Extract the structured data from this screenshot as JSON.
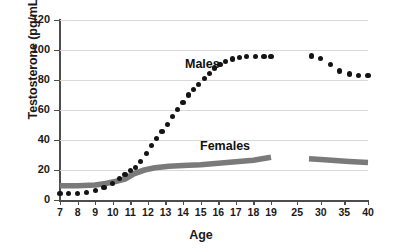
{
  "chart_data": {
    "type": "scatter",
    "title": "",
    "xlabel": "Age",
    "ylabel": "Testosterone (pg/mL)",
    "ylim": [
      0,
      120
    ],
    "ytick_values": [
      0,
      20,
      40,
      60,
      80,
      100,
      120
    ],
    "ytick_labels": [
      "0",
      "20",
      "40",
      "60",
      "80",
      "100",
      "120"
    ],
    "xtick_labels": [
      "7",
      "8",
      "9",
      "10",
      "11",
      "12",
      "13",
      "14",
      "15",
      "16",
      "17",
      "18",
      "19",
      "25",
      "30",
      "35",
      "40"
    ],
    "grid": true,
    "legend_position": "inline-annotations",
    "annotations": [
      {
        "text": "Males",
        "x": 13.2,
        "y": 86
      },
      {
        "text": "Females",
        "x": 14.6,
        "y": 34
      }
    ],
    "series": [
      {
        "name": "Males",
        "marker": "filled-circle",
        "color": "#141414",
        "segments": [
          {
            "x": [
              7.0,
              7.5,
              8.0,
              8.5,
              9.0,
              9.5,
              10.0,
              10.4,
              10.7,
              11.0,
              11.3,
              11.6,
              11.9,
              12.2,
              12.5,
              12.8,
              13.1,
              13.4,
              13.7,
              14.0,
              14.3,
              14.6,
              14.9,
              15.2,
              15.5,
              15.8,
              16.1,
              16.4,
              16.8,
              17.2,
              17.6,
              18.1,
              18.6,
              19.0
            ],
            "y": [
              4.5,
              4.5,
              4.6,
              4.8,
              6.5,
              8.5,
              11.0,
              14.5,
              17.0,
              19.5,
              21.5,
              25.5,
              31.0,
              36.5,
              41.0,
              45.5,
              50.5,
              55.5,
              60.5,
              65.0,
              70.0,
              73.5,
              77.0,
              81.0,
              84.5,
              88.0,
              90.5,
              92.5,
              94.0,
              95.0,
              95.5,
              95.5,
              95.5,
              95.5
            ]
          },
          {
            "x": [
              28.0,
              30.0,
              32.0,
              34.0,
              36.0,
              38.0,
              40.0
            ],
            "y": [
              96.0,
              94.5,
              90.5,
              86.0,
              84.0,
              83.0,
              83.0
            ]
          }
        ]
      },
      {
        "name": "Females",
        "marker": "thick-band",
        "color": "#7a7a7a",
        "segments": [
          {
            "x": [
              7.0,
              8.0,
              9.0,
              9.6,
              10.2,
              10.7,
              11.2,
              11.8,
              12.4,
              13.2,
              14.0,
              15.0,
              16.0,
              17.0,
              18.0,
              19.0
            ],
            "y": [
              9.5,
              9.5,
              10.0,
              11.0,
              12.5,
              14.0,
              17.5,
              20.0,
              21.5,
              22.5,
              23.0,
              23.5,
              24.5,
              25.5,
              26.5,
              28.5
            ]
          },
          {
            "x": [
              27.5,
              30.0,
              33.0,
              36.0,
              38.0,
              40.0
            ],
            "y": [
              27.5,
              27.0,
              26.3,
              25.7,
              25.3,
              25.0
            ]
          }
        ]
      }
    ]
  },
  "colors": {
    "male_marker": "#141414",
    "female_band": "#7a7a7a",
    "gridline": "#d9d9d9",
    "axis": "#4d4d4d",
    "text": "#1a1a1a"
  }
}
